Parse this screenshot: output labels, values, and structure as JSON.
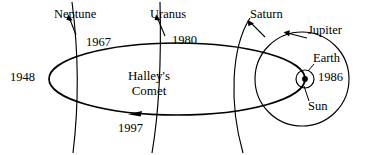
{
  "figure": {
    "background_color": "#ffffff",
    "stroke_color": "#000000",
    "width": 368,
    "height": 155
  },
  "comet": {
    "name_line1": "Halley's",
    "name_line2": "Comet",
    "direction_marker": "arrowhead-on-lower-orbit-pointing-left"
  },
  "year_markers": [
    {
      "id": "y1948",
      "label": "1948",
      "position": "aphelion-far-left"
    },
    {
      "id": "y1967",
      "label": "1967",
      "position": "upper-left-near-neptune-orbit"
    },
    {
      "id": "y1980",
      "label": "1980",
      "position": "upper-middle-near-uranus-orbit"
    },
    {
      "id": "y1986",
      "label": "1986",
      "position": "perihelion-at-sun"
    },
    {
      "id": "y1997",
      "label": "1997",
      "position": "lower-middle-below-orbit"
    }
  ],
  "planets": [
    {
      "id": "neptune",
      "label": "Neptune",
      "orbit": "arc"
    },
    {
      "id": "uranus",
      "label": "Uranus",
      "orbit": "arc"
    },
    {
      "id": "saturn",
      "label": "Saturn",
      "orbit": "arc"
    },
    {
      "id": "jupiter",
      "label": "Jupiter",
      "orbit": "circle"
    },
    {
      "id": "earth",
      "label": "Earth",
      "orbit": "small-circle"
    }
  ],
  "star": {
    "label": "Sun",
    "marker": "filled-dot-at-right-focus"
  }
}
